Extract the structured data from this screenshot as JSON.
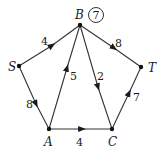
{
  "diagram": {
    "type": "directed-weighted-graph",
    "nodes": [
      {
        "id": "S",
        "label": "S",
        "x": 19,
        "y": 66
      },
      {
        "id": "B",
        "label": "B",
        "x": 80,
        "y": 25,
        "annotation": "7"
      },
      {
        "id": "T",
        "label": "T",
        "x": 141,
        "y": 67
      },
      {
        "id": "A",
        "label": "A",
        "x": 49,
        "y": 129
      },
      {
        "id": "C",
        "label": "C",
        "x": 112,
        "y": 129
      }
    ],
    "edges": [
      {
        "from": "S",
        "to": "B",
        "weight": "4"
      },
      {
        "from": "S",
        "to": "A",
        "weight": "8"
      },
      {
        "from": "A",
        "to": "B",
        "weight": "5"
      },
      {
        "from": "B",
        "to": "C",
        "weight": "2"
      },
      {
        "from": "B",
        "to": "T",
        "weight": "8"
      },
      {
        "from": "A",
        "to": "C",
        "weight": "4"
      },
      {
        "from": "C",
        "to": "T",
        "weight": "7"
      }
    ]
  }
}
